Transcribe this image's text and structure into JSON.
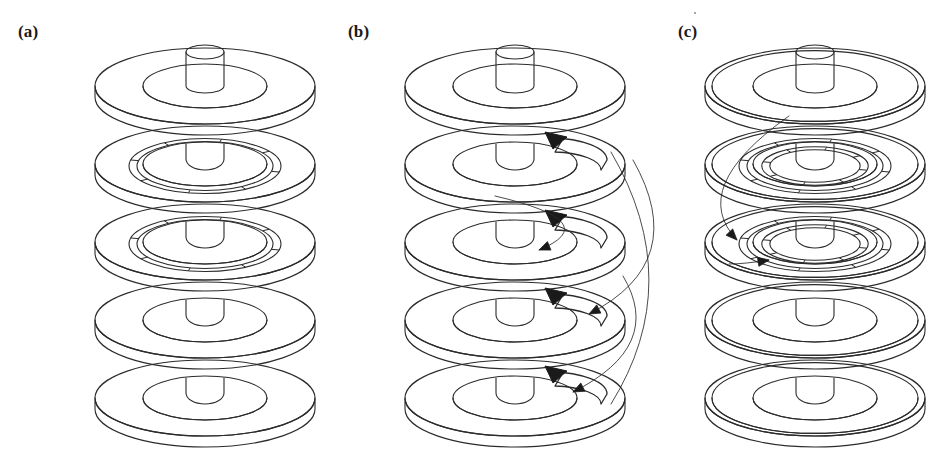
{
  "figure": {
    "background_color": "#ffffff",
    "line_color": "#2b2b2b",
    "arrow_color": "#1a1a1a",
    "width": 944,
    "height": 449
  },
  "panels": [
    {
      "id": "a",
      "label": "(a)",
      "label_x": 18,
      "label_y": 22,
      "center_x": 205,
      "description": "Stack of five disks on a central hub cylinder; disks 2 and 3 carry a single segmented tick ring.",
      "disk_count": 5,
      "segmented_ring_levels": [
        2,
        3
      ],
      "segmented_rings_per_disk": 1,
      "tick_count": 8,
      "double_rim": false,
      "arrows": []
    },
    {
      "id": "b",
      "label": "(b)",
      "label_x": 348,
      "label_y": 22,
      "center_x": 515,
      "description": "Same stack with thick curved block arrows on disk surfaces and thin connecting curves linking successive levels.",
      "disk_count": 5,
      "segmented_ring_levels": [],
      "segmented_rings_per_disk": 0,
      "tick_count": 0,
      "double_rim": false,
      "arrows": [
        {
          "name": "block-arrow-level-2",
          "level": 2,
          "kind": "block",
          "direction": "counter-clockwise"
        },
        {
          "name": "block-arrow-level-3",
          "level": 3,
          "kind": "block",
          "direction": "counter-clockwise"
        },
        {
          "name": "block-arrow-level-4",
          "level": 4,
          "kind": "block",
          "direction": "counter-clockwise"
        },
        {
          "name": "block-arrow-level-5",
          "level": 5,
          "kind": "block",
          "direction": "counter-clockwise"
        },
        {
          "name": "transfer-curve-2-to-3",
          "from_level": 2,
          "to_level": 3,
          "kind": "thin-curve"
        },
        {
          "name": "transfer-curve-3-to-4",
          "from_level": 3,
          "to_level": 4,
          "kind": "thin-curve"
        },
        {
          "name": "transfer-curve-4-to-5",
          "from_level": 4,
          "to_level": 5,
          "kind": "thin-curve"
        },
        {
          "name": "outer-loop-curve",
          "from_level": 2,
          "to_level": 5,
          "kind": "thin-curve"
        }
      ]
    },
    {
      "id": "c",
      "label": "(c)",
      "label_x": 678,
      "label_y": 22,
      "center_x": 815,
      "description": "Stack with thin outer rim bands; disks 2 and 3 carry two concentric segmented tick rings, with arrows converging on disk 3.",
      "disk_count": 5,
      "segmented_ring_levels": [
        2,
        3
      ],
      "segmented_rings_per_disk": 2,
      "tick_count": 8,
      "double_rim": true,
      "arrows": [
        {
          "name": "incoming-curve-to-level-3",
          "from_level": 1,
          "to_level": 3,
          "kind": "thin-curve"
        },
        {
          "name": "short-arrow-level-3",
          "level": 3,
          "kind": "thin-curve",
          "direction": "clockwise"
        }
      ]
    }
  ],
  "geometry": {
    "disk_outer_rx": 110,
    "disk_outer_ry": 38,
    "disk_mid_rx": 62,
    "disk_mid_ry": 22,
    "disk_thickness": 11,
    "hub_rx": 19,
    "hub_ry": 7,
    "hub_height": 34,
    "level_spacing": 78,
    "top_level_y": 86
  }
}
